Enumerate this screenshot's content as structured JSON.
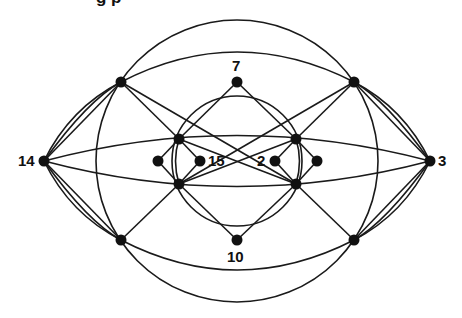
{
  "title_fragment": "g        p",
  "colors": {
    "stroke": "#1a1a1a",
    "node": "#111111",
    "background": "#ffffff"
  },
  "circles": [
    {
      "id": "outer-circle",
      "cx": 237,
      "cy": 161,
      "r": 141
    },
    {
      "id": "inner-circle",
      "cx": 237,
      "cy": 161,
      "r": 65
    }
  ],
  "nodes": [
    {
      "id": "n14",
      "x": 44,
      "y": 161,
      "label": "14",
      "lx": 18,
      "ly": 166
    },
    {
      "id": "n3",
      "x": 430,
      "y": 161,
      "label": "3",
      "lx": 438,
      "ly": 166
    },
    {
      "id": "nTL",
      "x": 121,
      "y": 82,
      "label": ""
    },
    {
      "id": "nTR",
      "x": 354,
      "y": 82,
      "label": ""
    },
    {
      "id": "nBL",
      "x": 121,
      "y": 240,
      "label": ""
    },
    {
      "id": "nBR",
      "x": 354,
      "y": 240,
      "label": ""
    },
    {
      "id": "n7",
      "x": 237,
      "y": 82,
      "label": "7",
      "lx": 232,
      "ly": 71
    },
    {
      "id": "n10",
      "x": 237,
      "y": 240,
      "label": "10",
      "lx": 227,
      "ly": 262
    },
    {
      "id": "nIUL",
      "x": 179,
      "y": 139,
      "label": ""
    },
    {
      "id": "nILL",
      "x": 179,
      "y": 184,
      "label": ""
    },
    {
      "id": "nIUR",
      "x": 296,
      "y": 139,
      "label": ""
    },
    {
      "id": "nILR",
      "x": 296,
      "y": 184,
      "label": ""
    },
    {
      "id": "nLL",
      "x": 158,
      "y": 161,
      "label": ""
    },
    {
      "id": "n15",
      "x": 200,
      "y": 161,
      "label": "15",
      "lx": 208,
      "ly": 166
    },
    {
      "id": "n2",
      "x": 275,
      "y": 161,
      "label": "2",
      "lx": 257,
      "ly": 166
    },
    {
      "id": "nRR",
      "x": 317,
      "y": 161,
      "label": ""
    }
  ],
  "edges": [
    {
      "d": "M44,161 L121,82"
    },
    {
      "d": "M44,161 Q70,108 121,82"
    },
    {
      "d": "M44,161 Q88,100 121,82"
    },
    {
      "d": "M44,161 L121,240"
    },
    {
      "d": "M44,161 Q70,214 121,240"
    },
    {
      "d": "M44,161 Q88,222 121,240"
    },
    {
      "d": "M430,161 L354,82"
    },
    {
      "d": "M430,161 Q404,108 354,82"
    },
    {
      "d": "M430,161 Q386,100 354,82"
    },
    {
      "d": "M430,161 L354,240"
    },
    {
      "d": "M430,161 Q404,214 354,240"
    },
    {
      "d": "M430,161 Q386,222 354,240"
    },
    {
      "d": "M44,161 Q237,110 430,161"
    },
    {
      "d": "M44,161 Q237,212 430,161"
    },
    {
      "d": "M121,82 Q237,22 354,82"
    },
    {
      "d": "M121,240 Q237,300 354,240"
    },
    {
      "d": "M121,82 L179,139"
    },
    {
      "d": "M121,240 L179,184"
    },
    {
      "d": "M354,82 L296,139"
    },
    {
      "d": "M354,240 L296,184"
    },
    {
      "d": "M179,139 L296,184"
    },
    {
      "d": "M179,184 L296,139"
    },
    {
      "d": "M121,82 L296,184"
    },
    {
      "d": "M354,82 L179,184"
    },
    {
      "d": "M237,82 L179,139"
    },
    {
      "d": "M237,82 L296,139"
    },
    {
      "d": "M237,240 L179,184"
    },
    {
      "d": "M237,240 L296,184"
    },
    {
      "d": "M179,139 L158,161"
    },
    {
      "d": "M179,184 L158,161"
    },
    {
      "d": "M179,139 L200,161"
    },
    {
      "d": "M179,184 L200,161"
    },
    {
      "d": "M296,139 L275,161"
    },
    {
      "d": "M296,184 L275,161"
    },
    {
      "d": "M296,139 L317,161"
    },
    {
      "d": "M296,184 L317,161"
    },
    {
      "d": "M179,139 Q172,161 179,184"
    },
    {
      "d": "M296,139 Q303,161 296,184"
    }
  ]
}
